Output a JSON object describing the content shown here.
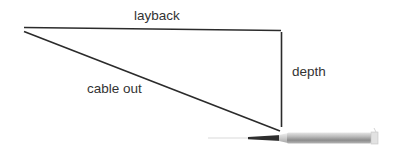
{
  "diagram": {
    "labels": {
      "layback": "layback",
      "depth": "depth",
      "cable_out": "cable out"
    },
    "colors": {
      "line": "#2b2b2b",
      "text": "#333333",
      "body_light": "#d8d8d8",
      "body_dark": "#8a8a8a"
    }
  }
}
